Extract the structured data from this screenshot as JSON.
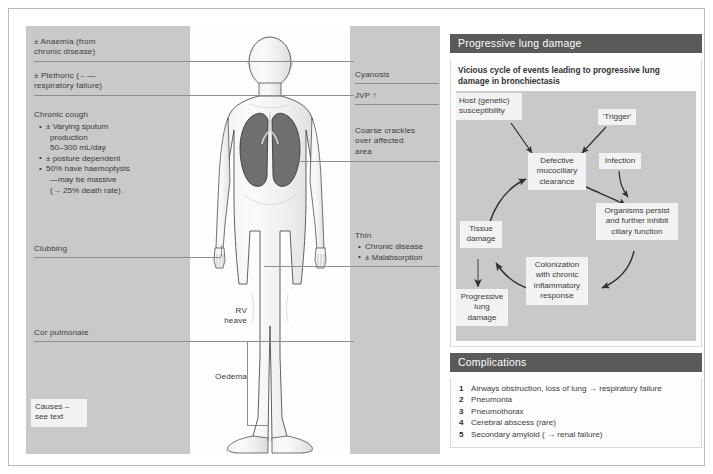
{
  "left_labels": [
    {
      "id": "anaemia",
      "text": "± Anaemia (from\nchronic disease)"
    },
    {
      "id": "plethoric",
      "text": "± Plethoric (←—\nrespiratory failure)"
    },
    {
      "id": "chronic-cough",
      "text": "Chronic cough"
    },
    {
      "id": "clubbing",
      "text": "Clubbing"
    },
    {
      "id": "cor-pulmonale",
      "text": "Cor pulmonale"
    }
  ],
  "chronic_cough_bullets": [
    {
      "text": "± Varying sputum",
      "cont": [
        "production",
        "50–300 mL/day"
      ]
    },
    {
      "text": "± posture dependent",
      "cont": []
    },
    {
      "text": "50% have haemoptysis",
      "cont": [
        "—may be massive",
        "(→ 25% death rate)"
      ]
    }
  ],
  "causes_box": "Causes\n– see text",
  "mid_labels": [
    {
      "id": "rv-heave",
      "text": "RV\nheave"
    },
    {
      "id": "oedema",
      "text": "Oedema"
    }
  ],
  "right_labels": [
    {
      "id": "cyanosis",
      "text": "Cyanosis"
    },
    {
      "id": "jvp",
      "text": "JVP ↑"
    },
    {
      "id": "coarse-crackles",
      "text": "Coarse crackles\nover affected\narea"
    },
    {
      "id": "thin",
      "text": "Thin"
    }
  ],
  "thin_bullets": [
    "Chronic disease",
    "± Malabsorption"
  ],
  "progressive_panel": {
    "title": "Progressive lung damage",
    "intro": "Vicious cycle of events leading to progressive lung damage in bronchiectasis",
    "nodes": [
      {
        "id": "host-susceptibility",
        "text": "Host (genetic)\nsusceptibility"
      },
      {
        "id": "trigger",
        "text": "'Trigger'"
      },
      {
        "id": "defective-clearance",
        "text": "Defective\nmucociliary\nclearance"
      },
      {
        "id": "infection",
        "text": "Infection"
      },
      {
        "id": "organisms-persist",
        "text": "Organisms persist\nand further inhibit\nciliary function"
      },
      {
        "id": "colonization",
        "text": "Colonization\nwith chronic\ninflammatory\nresponse"
      },
      {
        "id": "tissue-damage",
        "text": "Tissue\ndamage"
      },
      {
        "id": "progressive-lung-damage",
        "text": "Progressive\nlung\ndamage"
      }
    ]
  },
  "complications_panel": {
    "title": "Complications",
    "items": [
      {
        "num": "1",
        "text": "Airways obstruction, loss of lung → respiratory failure"
      },
      {
        "num": "2",
        "text": "Pneumonia"
      },
      {
        "num": "3",
        "text": "Pneumothorax"
      },
      {
        "num": "4",
        "text": "Cerebral abscess (rare)"
      },
      {
        "num": "5",
        "text": "Secondary amyloid ( → renal failure)"
      }
    ]
  },
  "colors": {
    "panel_gray": "#c9c9c9",
    "header_gray": "#5a5a5a",
    "box_fill": "#f2f2f2",
    "lung_fill": "#6f6f6f",
    "text": "#3b3b3b",
    "leader": "#8d8d8d"
  }
}
